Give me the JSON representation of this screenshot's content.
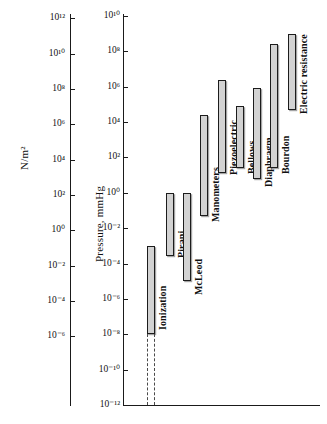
{
  "chart_data": {
    "type": "bar",
    "orientation": "vertical-range",
    "title": "",
    "subtitle": "",
    "left_axis": {
      "label": "N/m2",
      "label_display": "N/m²",
      "scale": "log10",
      "ticks": [
        12,
        10,
        8,
        6,
        4,
        2,
        0,
        -2,
        -4,
        -6
      ],
      "tick_labels": [
        "10¹²",
        "10¹⁰",
        "10⁸",
        "10⁶",
        "10⁴",
        "10²",
        "10⁰",
        "10⁻²",
        "10⁻⁴",
        "10⁻⁶"
      ],
      "range": [
        -8,
        13
      ]
    },
    "right_axis": {
      "label": "Pressure, mmHg",
      "scale": "log10",
      "ticks": [
        10,
        8,
        6,
        4,
        2,
        0,
        -2,
        -4,
        -6,
        -8,
        -10,
        -12
      ],
      "tick_labels": [
        "10¹⁰",
        "10⁸",
        "10⁶",
        "10⁴",
        "10²",
        "10⁰",
        "10⁻²",
        "10⁻⁴",
        "10⁻⁶",
        "10⁻⁸",
        "10⁻¹⁰",
        "10⁻¹²"
      ],
      "range": [
        -12,
        10
      ],
      "grid": false,
      "legend": "none"
    },
    "units": "mmHg",
    "categories": [
      "Ionization",
      "Pirani",
      "McLeod",
      "Manometers",
      "Piezoelectric",
      "Bellows",
      "Diaphragm",
      "Bourdon",
      "Electric resistance"
    ],
    "series": [
      {
        "name": "Pressure measurement range (mmHg)",
        "ranges": [
          {
            "category": "Ionization",
            "low_exp": -8,
            "high_exp": -3,
            "low": "1e-8",
            "high": "1e-3",
            "dashed_extension_to_exp": -12
          },
          {
            "category": "Pirani",
            "low_exp": -3.6,
            "high_exp": 0,
            "low": "2.5e-4",
            "high": "1e0"
          },
          {
            "category": "McLeod",
            "low_exp": -5,
            "high_exp": 0,
            "low": "1e-5",
            "high": "1e0"
          },
          {
            "category": "Manometers",
            "low_exp": -1.3,
            "high_exp": 4.4,
            "low": "5e-2",
            "high": "2.5e4"
          },
          {
            "category": "Piezoelectric",
            "low_exp": 1.1,
            "high_exp": 6.4,
            "low": "1.2e1",
            "high": "2.5e6"
          },
          {
            "category": "Bellows",
            "low_exp": 1.4,
            "high_exp": 4.9,
            "low": "2.5e1",
            "high": "8e4"
          },
          {
            "category": "Diaphragm",
            "low_exp": 0.8,
            "high_exp": 5.9,
            "low": "6e0",
            "high": "8e5"
          },
          {
            "category": "Bourdon",
            "low_exp": 1.4,
            "high_exp": 8.4,
            "low": "2.5e1",
            "high": "2.5e8"
          },
          {
            "category": "Electric resistance",
            "low_exp": 4.7,
            "high_exp": 9.0,
            "low": "5e4",
            "high": "1e9"
          }
        ]
      }
    ]
  },
  "style": {
    "bar_fill": "#d2d2d2",
    "bar_stroke": "#1c1c1c",
    "axis_color": "#1a1a1a",
    "background": "#ffffff",
    "dash_color": "#4a4a4a"
  }
}
